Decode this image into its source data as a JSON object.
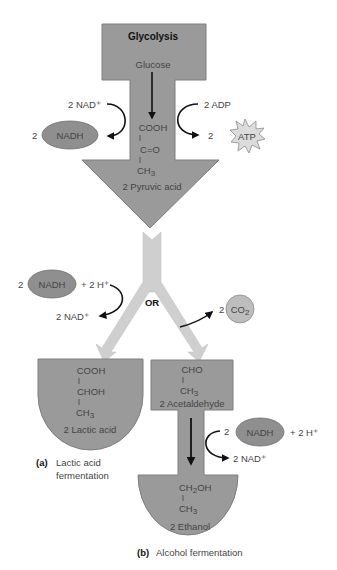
{
  "colors": {
    "shape_fill": "#9a9a9a",
    "shape_stroke": "#7a7a7a",
    "pipe_fill": "#cfcfcf",
    "ellipse_fill": "#8f8f8f",
    "co2_fill": "#bdbdbd",
    "atp_fill": "#dcdcdc",
    "arrow": "#111111",
    "text": "#444444"
  },
  "glycolysis": {
    "title": "Glycolysis",
    "input": "Glucose",
    "left_input": "2 NAD⁺",
    "left_coef": "2",
    "left_output": "NADH",
    "right_input": "2 ADP",
    "right_coef": "2",
    "right_output": "ATP",
    "product_formula": {
      "line1": "COOH",
      "bond1": "|",
      "line2": "C=O",
      "bond2": "|",
      "line3": "CH",
      "line3_sub": "3"
    },
    "product": "2 Pyruvic acid"
  },
  "branch": {
    "or_label": "OR",
    "left_coef": "2",
    "left_reactant": "NADH",
    "left_plus": "+ 2 H⁺",
    "left_output": "2 NAD⁺",
    "right_coef": "2",
    "right_output": "CO",
    "right_output_sub": "2"
  },
  "lactic": {
    "formula": {
      "line1": "COOH",
      "bond1": "|",
      "line2": "CHOH",
      "bond2": "|",
      "line3": "CH",
      "line3_sub": "3"
    },
    "product": "2 Lactic acid",
    "caption_letter": "(a)",
    "caption_line1": "Lactic acid",
    "caption_line2": "fermentation"
  },
  "alcohol": {
    "intermediate_formula": {
      "line1": "CHO",
      "bond1": "|",
      "line2": "CH",
      "line2_sub": "3"
    },
    "intermediate": "2 Acetaldehyde",
    "nadh_coef": "2",
    "nadh": "NADH",
    "nadh_plus": "+ 2 H⁺",
    "nad_output": "2 NAD⁺",
    "final_formula": {
      "line1a": "CH",
      "line1_sub": "2",
      "line1b": "OH",
      "bond1": "|",
      "line2": "CH",
      "line2_sub": "3"
    },
    "product": "2 Ethanol",
    "caption_letter": "(b)",
    "caption_text": "Alcohol fermentation"
  }
}
